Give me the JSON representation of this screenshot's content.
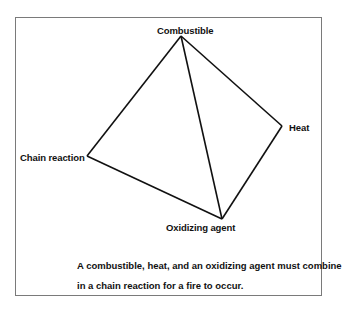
{
  "diagram": {
    "type": "fire tetrahedron",
    "vertices": {
      "combustible": "Combustible",
      "heat": "Heat",
      "chain_reaction": "Chain reaction",
      "oxidizing_agent": "Oxidizing agent"
    },
    "caption_line1": "A combustible, heat, and an oxidizing agent must combine",
    "caption_line2": "in a chain reaction for a fire to occur."
  }
}
